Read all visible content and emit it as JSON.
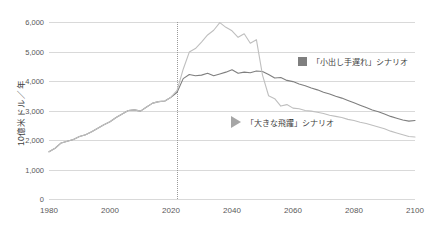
{
  "chart_data": {
    "type": "line",
    "title": "",
    "xlabel": "",
    "ylabel": "10億米ドル／年",
    "xlim": [
      1980,
      2100
    ],
    "ylim": [
      0,
      6000
    ],
    "xticks": [
      1980,
      2000,
      2020,
      2040,
      2060,
      2080,
      2100
    ],
    "yticks": [
      0,
      1000,
      2000,
      3000,
      4000,
      5000,
      6000
    ],
    "ytick_labels": [
      "0",
      "1,000",
      "2,000",
      "3,000",
      "4,000",
      "5,000",
      "6,000"
    ],
    "xtick_labels": [
      "1980",
      "2000",
      "2020",
      "2040",
      "2060",
      "2080",
      "2100"
    ],
    "grid": true,
    "legend_position": "inside-right",
    "annotations": [
      {
        "name": "projection-divider",
        "type": "vline",
        "x": 2022,
        "style": "dotted",
        "color": "#9a9a9a"
      }
    ],
    "series": [
      {
        "name": "「小出し手遅れ」シナリオ",
        "color": "#7f7f7f",
        "marker": "square",
        "x": [
          1980,
          1982,
          1984,
          1986,
          1988,
          1990,
          1992,
          1994,
          1996,
          1998,
          2000,
          2002,
          2004,
          2006,
          2008,
          2010,
          2012,
          2014,
          2016,
          2018,
          2020,
          2022,
          2024,
          2026,
          2028,
          2030,
          2032,
          2034,
          2036,
          2038,
          2040,
          2042,
          2044,
          2046,
          2048,
          2050,
          2052,
          2054,
          2056,
          2058,
          2060,
          2062,
          2064,
          2066,
          2068,
          2070,
          2072,
          2074,
          2076,
          2078,
          2080,
          2082,
          2084,
          2086,
          2088,
          2090,
          2092,
          2094,
          2096,
          2098,
          2100
        ],
        "values": [
          1600,
          1720,
          1900,
          1960,
          2020,
          2120,
          2180,
          2280,
          2400,
          2520,
          2620,
          2760,
          2880,
          3000,
          3020,
          2980,
          3120,
          3250,
          3300,
          3320,
          3450,
          3620,
          4080,
          4220,
          4180,
          4200,
          4260,
          4180,
          4240,
          4300,
          4380,
          4260,
          4300,
          4280,
          4340,
          4320,
          4220,
          4100,
          4120,
          4020,
          3980,
          3900,
          3840,
          3760,
          3700,
          3620,
          3560,
          3480,
          3420,
          3340,
          3260,
          3180,
          3100,
          3020,
          2960,
          2880,
          2800,
          2740,
          2680,
          2640,
          2660
        ]
      },
      {
        "name": "「大きな飛躍」シナリオ",
        "color": "#bfbfbf",
        "marker": "triangle",
        "x": [
          1980,
          1982,
          1984,
          1986,
          1988,
          1990,
          1992,
          1994,
          1996,
          1998,
          2000,
          2002,
          2004,
          2006,
          2008,
          2010,
          2012,
          2014,
          2016,
          2018,
          2020,
          2022,
          2024,
          2026,
          2028,
          2030,
          2032,
          2034,
          2036,
          2038,
          2040,
          2042,
          2044,
          2046,
          2048,
          2050,
          2052,
          2054,
          2056,
          2058,
          2060,
          2062,
          2064,
          2066,
          2068,
          2070,
          2072,
          2074,
          2076,
          2078,
          2080,
          2082,
          2084,
          2086,
          2088,
          2090,
          2092,
          2094,
          2096,
          2098,
          2100
        ],
        "values": [
          1600,
          1720,
          1900,
          1960,
          2020,
          2120,
          2180,
          2280,
          2400,
          2520,
          2620,
          2760,
          2880,
          3000,
          3020,
          2980,
          3120,
          3250,
          3300,
          3320,
          3450,
          3680,
          4400,
          4980,
          5100,
          5320,
          5560,
          5720,
          5980,
          5820,
          5700,
          5480,
          5600,
          5280,
          5400,
          4200,
          3500,
          3400,
          3150,
          3200,
          3080,
          3060,
          3000,
          2980,
          2940,
          2900,
          2840,
          2800,
          2760,
          2700,
          2660,
          2600,
          2560,
          2500,
          2440,
          2380,
          2300,
          2240,
          2180,
          2120,
          2100
        ]
      }
    ]
  },
  "legend": {
    "late_label": "「小出し手遅れ」シナリオ",
    "leap_label": "「大きな飛躍」シナリオ"
  },
  "axes": {
    "y_title": "10億米ドル／年"
  }
}
